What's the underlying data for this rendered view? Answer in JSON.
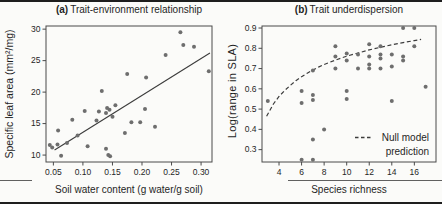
{
  "style": {
    "background": "#fbfbf9",
    "text_color": "#262626",
    "axis_color": "#4a4a4a",
    "point_color": "#6e6e6e",
    "line_color": "#3c3c3c"
  },
  "chart_data": [
    {
      "type": "scatter",
      "panel": "a",
      "title_prefix": "(a)",
      "title": "Trait-environment relationship",
      "xlabel": "Soil water content (g water/g soil)",
      "ylabel": "Specific leaf area (mm²/mg)",
      "xlim": [
        0.0375,
        0.3185
      ],
      "ylim": [
        8.9,
        30.5
      ],
      "xticks": [
        0.05,
        0.1,
        0.15,
        0.2,
        0.25,
        0.3
      ],
      "xtick_labels": [
        "0.05",
        "0.10",
        "0.15",
        "0.20",
        "0.25",
        "0.30"
      ],
      "yticks": [
        10,
        15,
        20,
        25,
        30
      ],
      "ytick_labels": [
        "10",
        "15",
        "20",
        "25",
        "30"
      ],
      "grid": false,
      "points": [
        [
          0.044,
          11.6
        ],
        [
          0.048,
          11.2
        ],
        [
          0.057,
          11.7
        ],
        [
          0.058,
          13.9
        ],
        [
          0.063,
          9.9
        ],
        [
          0.073,
          11.9
        ],
        [
          0.082,
          15.6
        ],
        [
          0.091,
          13.1
        ],
        [
          0.103,
          17.0
        ],
        [
          0.108,
          11.4
        ],
        [
          0.123,
          15.5
        ],
        [
          0.127,
          16.9
        ],
        [
          0.132,
          20.2
        ],
        [
          0.139,
          11.0
        ],
        [
          0.143,
          10.0
        ],
        [
          0.146,
          9.8
        ],
        [
          0.139,
          16.7
        ],
        [
          0.141,
          17.5
        ],
        [
          0.145,
          17.2
        ],
        [
          0.15,
          16.1
        ],
        [
          0.155,
          17.9
        ],
        [
          0.171,
          13.5
        ],
        [
          0.175,
          22.9
        ],
        [
          0.182,
          15.2
        ],
        [
          0.197,
          15.2
        ],
        [
          0.205,
          17.3
        ],
        [
          0.207,
          22.3
        ],
        [
          0.222,
          14.5
        ],
        [
          0.24,
          25.9
        ],
        [
          0.265,
          29.5
        ],
        [
          0.27,
          27.5
        ],
        [
          0.288,
          27.2
        ],
        [
          0.313,
          23.3
        ]
      ],
      "fit_line": {
        "x1": 0.052,
        "y1": 10.8,
        "x2": 0.315,
        "y2": 26.2
      }
    },
    {
      "type": "scatter",
      "panel": "b",
      "title_prefix": "(b)",
      "title": "Trait underdispersion",
      "xlabel": "Species richness",
      "ylabel": "Log(range in SLA)",
      "xlim": [
        2.49,
        17.92
      ],
      "ylim": [
        0.239,
        0.91
      ],
      "xticks": [
        4,
        6,
        8,
        10,
        12,
        14,
        16
      ],
      "xtick_labels": [
        "4",
        "6",
        "8",
        "10",
        "12",
        "14",
        "16"
      ],
      "yticks": [
        0.3,
        0.4,
        0.5,
        0.6,
        0.7,
        0.8,
        0.9
      ],
      "ytick_labels": [
        "0.3",
        "0.4",
        "0.5",
        "0.6",
        "0.7",
        "0.8",
        "0.9"
      ],
      "grid": false,
      "points": [
        [
          3,
          0.54
        ],
        [
          6,
          0.59
        ],
        [
          6,
          0.53
        ],
        [
          6,
          0.25
        ],
        [
          7,
          0.69
        ],
        [
          7,
          0.57
        ],
        [
          7,
          0.545
        ],
        [
          7,
          0.35
        ],
        [
          7,
          0.25
        ],
        [
          8,
          0.4
        ],
        [
          9,
          0.81
        ],
        [
          9,
          0.76
        ],
        [
          9,
          0.7
        ],
        [
          10,
          0.775
        ],
        [
          10,
          0.74
        ],
        [
          10,
          0.59
        ],
        [
          10,
          0.55
        ],
        [
          11,
          0.77
        ],
        [
          11,
          0.7
        ],
        [
          12,
          0.82
        ],
        [
          12,
          0.76
        ],
        [
          12,
          0.72
        ],
        [
          12,
          0.7
        ],
        [
          13,
          0.81
        ],
        [
          13,
          0.77
        ],
        [
          13,
          0.75
        ],
        [
          13,
          0.7
        ],
        [
          14,
          0.77
        ],
        [
          14,
          0.71
        ],
        [
          14,
          0.54
        ],
        [
          15,
          0.9
        ],
        [
          15,
          0.76
        ],
        [
          15,
          0.74
        ],
        [
          16,
          0.9
        ],
        [
          16,
          0.81
        ],
        [
          17,
          0.61
        ]
      ],
      "null_model_curve": [
        [
          2.9,
          0.465
        ],
        [
          3.5,
          0.525
        ],
        [
          4,
          0.562
        ],
        [
          4.5,
          0.592
        ],
        [
          5,
          0.617
        ],
        [
          5.5,
          0.64
        ],
        [
          6,
          0.66
        ],
        [
          6.5,
          0.677
        ],
        [
          7,
          0.693
        ],
        [
          7.5,
          0.707
        ],
        [
          8,
          0.72
        ],
        [
          9,
          0.742
        ],
        [
          10,
          0.761
        ],
        [
          11,
          0.777
        ],
        [
          12,
          0.792
        ],
        [
          13,
          0.805
        ],
        [
          14,
          0.817
        ],
        [
          15,
          0.828
        ],
        [
          16,
          0.838
        ],
        [
          16.6,
          0.844
        ]
      ],
      "legend": {
        "dash_sample": "---",
        "label_line1": "Null model",
        "label_line2": "prediction"
      }
    }
  ]
}
